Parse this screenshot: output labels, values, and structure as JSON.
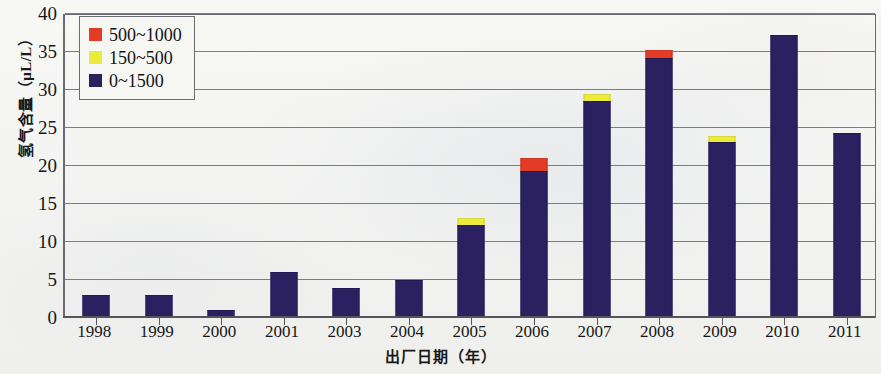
{
  "chart_data": {
    "type": "bar",
    "subtype": "stacked-bar",
    "title": "",
    "xlabel": "出厂日期（年）",
    "ylabel": "氢气含量（μL/L）",
    "ylim": [
      0,
      40
    ],
    "y_ticks": [
      0,
      5,
      10,
      15,
      20,
      25,
      30,
      35,
      40
    ],
    "y_tick_labels": [
      "0",
      "5",
      "10",
      "15",
      "20",
      "25",
      "30",
      "35",
      "40"
    ],
    "grid": "horizontal",
    "legend_position": "upper-left-inside",
    "categories": [
      "1998",
      "1999",
      "2000",
      "2001",
      "2003",
      "2004",
      "2005",
      "2006",
      "2007",
      "2008",
      "2009",
      "2010",
      "2011"
    ],
    "series": [
      {
        "name": "0~1500",
        "color": "#2b2060",
        "values": [
          3.0,
          3.0,
          1.0,
          6.0,
          4.0,
          5.0,
          12.3,
          19.3,
          28.6,
          34.2,
          23.1,
          37.2,
          24.3
        ]
      },
      {
        "name": "150~500",
        "color": "#ebeb3a",
        "values": [
          0,
          0,
          0,
          0,
          0,
          0,
          0.9,
          0,
          0.9,
          0,
          0.9,
          0,
          0
        ]
      },
      {
        "name": "500~1000",
        "color": "#e23c26",
        "values": [
          0,
          0,
          0,
          0,
          0,
          0,
          0,
          1.8,
          0,
          1.1,
          0,
          0,
          0
        ]
      }
    ],
    "totals": [
      3.0,
      3.0,
      1.0,
      6.0,
      4.0,
      5.0,
      13.2,
      21.1,
      29.5,
      35.3,
      24.0,
      37.2,
      24.3
    ]
  },
  "legend": {
    "items": [
      {
        "label": "500~1000",
        "color": "#e23c26"
      },
      {
        "label": "150~500",
        "color": "#ebeb3a"
      },
      {
        "label": "0~1500",
        "color": "#2b2060"
      }
    ]
  },
  "axes": {
    "y_title": "氢气含量（μL/L）",
    "x_title": "出厂日期（年）"
  }
}
